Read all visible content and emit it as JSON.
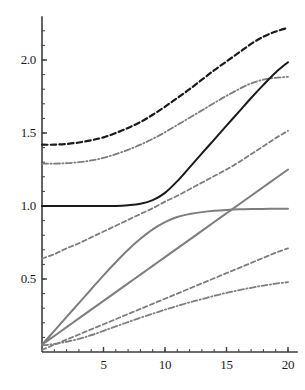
{
  "chart_data": {
    "type": "line",
    "title": "",
    "subtitle": "",
    "xlabel": "k",
    "ylabel": "",
    "xlim": [
      0,
      20.8
    ],
    "ylim": [
      0,
      2.3
    ],
    "grid": false,
    "legend": "none",
    "x_ticks": [
      {
        "value": 5,
        "label": "5"
      },
      {
        "value": 10,
        "label": "10"
      },
      {
        "value": 15,
        "label": "15"
      },
      {
        "value": 20,
        "label": "20"
      }
    ],
    "y_ticks": [
      {
        "value": 0.5,
        "label": "0.5"
      },
      {
        "value": 1.0,
        "label": "1.0"
      },
      {
        "value": 1.5,
        "label": "1.5"
      },
      {
        "value": 2.0,
        "label": "2.0"
      }
    ],
    "x_minor_tick_step": 1,
    "y_minor_tick_step": 0.1,
    "colors": {
      "black": "#1a1a1a",
      "gray": "#7d7d7d",
      "axis": "#3d3d3d",
      "background": "#ffffff"
    },
    "series": [
      {
        "name": "upper-black-dashed",
        "color": "#1a1a1a",
        "style": "dashed",
        "width": 2.2,
        "x": [
          0,
          1,
          2,
          3,
          4,
          5,
          6,
          7,
          8,
          9,
          10,
          11,
          12,
          13,
          14,
          15,
          16,
          17,
          18,
          19,
          20
        ],
        "values": [
          1.42,
          1.42,
          1.425,
          1.435,
          1.45,
          1.47,
          1.5,
          1.535,
          1.575,
          1.625,
          1.68,
          1.74,
          1.8,
          1.865,
          1.93,
          1.99,
          2.05,
          2.11,
          2.16,
          2.195,
          2.22
        ]
      },
      {
        "name": "upper-gray-dashdot",
        "color": "#7d7d7d",
        "style": "dashdot",
        "width": 1.8,
        "x": [
          0,
          1,
          2,
          3,
          4,
          5,
          6,
          7,
          8,
          9,
          10,
          11,
          12,
          13,
          14,
          15,
          16,
          17,
          18,
          19,
          20
        ],
        "values": [
          1.29,
          1.29,
          1.293,
          1.3,
          1.312,
          1.33,
          1.355,
          1.385,
          1.42,
          1.46,
          1.505,
          1.555,
          1.605,
          1.655,
          1.705,
          1.755,
          1.8,
          1.84,
          1.865,
          1.878,
          1.885
        ]
      },
      {
        "name": "black-solid-kink",
        "color": "#1a1a1a",
        "style": "solid",
        "width": 2.0,
        "x": [
          0,
          1,
          2,
          3,
          4,
          5,
          6,
          7,
          8,
          9,
          10,
          11,
          12,
          13,
          14,
          15,
          16,
          17,
          18,
          19,
          20
        ],
        "values": [
          1.0,
          1.0,
          1.0,
          1.0,
          1.0,
          1.0,
          1.0,
          1.005,
          1.015,
          1.04,
          1.09,
          1.17,
          1.265,
          1.36,
          1.455,
          1.55,
          1.645,
          1.74,
          1.83,
          1.915,
          1.985
        ]
      },
      {
        "name": "mid-gray-dashed",
        "color": "#7d7d7d",
        "style": "dashed",
        "width": 1.8,
        "x": [
          0,
          1,
          2,
          3,
          4,
          5,
          6,
          7,
          8,
          9,
          10,
          11,
          12,
          13,
          14,
          15,
          16,
          17,
          18,
          19,
          20
        ],
        "values": [
          0.64,
          0.67,
          0.71,
          0.745,
          0.785,
          0.825,
          0.865,
          0.905,
          0.945,
          0.985,
          1.03,
          1.07,
          1.115,
          1.16,
          1.205,
          1.25,
          1.3,
          1.355,
          1.41,
          1.465,
          1.515
        ]
      },
      {
        "name": "gray-solid-saturating",
        "color": "#7d7d7d",
        "style": "solid",
        "width": 2.0,
        "x": [
          0,
          1,
          2,
          3,
          4,
          5,
          6,
          7,
          8,
          9,
          10,
          11,
          12,
          13,
          14,
          15,
          16,
          17,
          18,
          19,
          20
        ],
        "values": [
          0.05,
          0.145,
          0.24,
          0.335,
          0.43,
          0.525,
          0.615,
          0.7,
          0.775,
          0.84,
          0.89,
          0.925,
          0.945,
          0.958,
          0.967,
          0.973,
          0.977,
          0.979,
          0.98,
          0.981,
          0.982
        ]
      },
      {
        "name": "gray-solid-linear",
        "color": "#7d7d7d",
        "style": "solid",
        "width": 2.0,
        "x": [
          0,
          1,
          2,
          3,
          4,
          5,
          6,
          7,
          8,
          9,
          10,
          11,
          12,
          13,
          14,
          15,
          16,
          17,
          18,
          19,
          20
        ],
        "values": [
          0.05,
          0.11,
          0.17,
          0.23,
          0.29,
          0.35,
          0.41,
          0.47,
          0.53,
          0.59,
          0.65,
          0.71,
          0.77,
          0.83,
          0.89,
          0.95,
          1.01,
          1.07,
          1.13,
          1.19,
          1.25
        ]
      },
      {
        "name": "lower-gray-dashed",
        "color": "#7d7d7d",
        "style": "dashed",
        "width": 1.8,
        "x": [
          0,
          1,
          2,
          3,
          4,
          5,
          6,
          7,
          8,
          9,
          10,
          11,
          12,
          13,
          14,
          15,
          16,
          17,
          18,
          19,
          20
        ],
        "values": [
          0.015,
          0.05,
          0.085,
          0.12,
          0.155,
          0.19,
          0.225,
          0.26,
          0.295,
          0.33,
          0.365,
          0.4,
          0.435,
          0.47,
          0.505,
          0.54,
          0.575,
          0.61,
          0.645,
          0.68,
          0.71
        ]
      },
      {
        "name": "lower-gray-dashdot",
        "color": "#7d7d7d",
        "style": "dashdot",
        "width": 1.8,
        "x": [
          0,
          1,
          2,
          3,
          4,
          5,
          6,
          7,
          8,
          9,
          10,
          11,
          12,
          13,
          14,
          15,
          16,
          17,
          18,
          19,
          20
        ],
        "values": [
          0.045,
          0.055,
          0.07,
          0.09,
          0.115,
          0.145,
          0.175,
          0.205,
          0.235,
          0.262,
          0.29,
          0.315,
          0.34,
          0.362,
          0.385,
          0.405,
          0.423,
          0.44,
          0.455,
          0.468,
          0.478
        ]
      }
    ]
  }
}
